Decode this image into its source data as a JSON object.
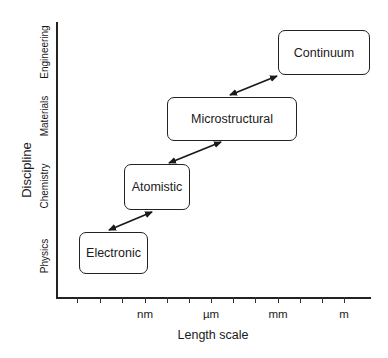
{
  "diagram": {
    "type": "multiscale-modeling-hierarchy",
    "y_axis": {
      "title": "Discipline",
      "categories": [
        "Physics",
        "Chemistry",
        "Materials",
        "Engineering"
      ]
    },
    "x_axis": {
      "title": "Length scale",
      "tick_labels": [
        "nm",
        "µm",
        "mm",
        "m"
      ],
      "tick_count": 13
    },
    "boxes": [
      {
        "id": "electronic",
        "label": "Electronic"
      },
      {
        "id": "atomistic",
        "label": "Atomistic"
      },
      {
        "id": "microstructural",
        "label": "Microstructural"
      },
      {
        "id": "continuum",
        "label": "Continuum"
      }
    ],
    "connections": [
      {
        "from": "electronic",
        "to": "atomistic",
        "style": "double-arrow"
      },
      {
        "from": "atomistic",
        "to": "microstructural",
        "style": "double-arrow"
      },
      {
        "from": "microstructural",
        "to": "continuum",
        "style": "double-arrow"
      }
    ],
    "colors": {
      "ink": "#222222",
      "background": "#ffffff"
    }
  }
}
